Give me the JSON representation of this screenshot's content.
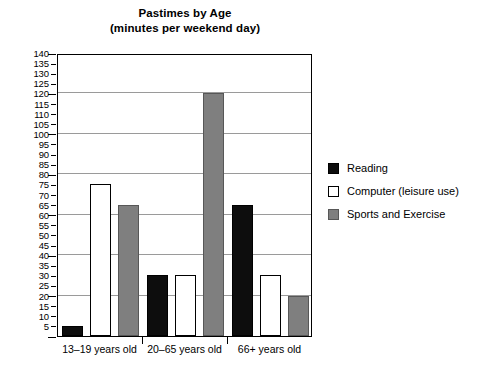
{
  "chart_data": {
    "type": "bar",
    "title": "Pastimes by Age",
    "subtitle": "(minutes per weekend day)",
    "xlabel": "",
    "ylabel": "",
    "ylim": [
      0,
      140
    ],
    "ytick_step": 5,
    "gridline_step": 20,
    "grid": true,
    "legend_position": "right",
    "categories": [
      "13–19 years old",
      "20–65 years old",
      "66+ years old"
    ],
    "series": [
      {
        "name": "Reading",
        "color": "#0d0d0d",
        "values": [
          5,
          30,
          65
        ]
      },
      {
        "name": "Computer (leisure use)",
        "color": "#ffffff",
        "values": [
          75,
          30,
          30
        ]
      },
      {
        "name": "Sports and Exercise",
        "color": "#7f7f7f",
        "values": [
          65,
          120,
          20
        ]
      }
    ],
    "ytick_labels": [
      "0",
      "5",
      "10",
      "15",
      "20",
      "25",
      "30",
      "35",
      "40",
      "45",
      "50",
      "55",
      "60",
      "65",
      "70",
      "75",
      "80",
      "85",
      "90",
      "95",
      "100",
      "105",
      "110",
      "115",
      "120",
      "125",
      "130",
      "135",
      "140"
    ],
    "gridline_values": [
      20,
      40,
      60,
      80,
      100,
      120,
      140
    ]
  },
  "legend": {
    "items": [
      {
        "label": "Reading"
      },
      {
        "label": "Computer (leisure use)"
      },
      {
        "label": "Sports and Exercise"
      }
    ]
  }
}
